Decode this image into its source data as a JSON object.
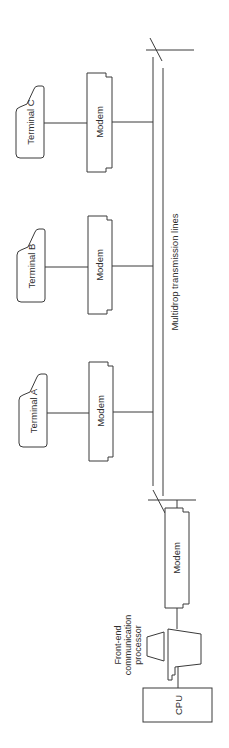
{
  "diagram": {
    "orientation": "rotated-90-ccw",
    "terminals": [
      {
        "id": "C",
        "label": "Terminal C"
      },
      {
        "id": "B",
        "label": "Terminal B"
      },
      {
        "id": "A",
        "label": "Terminal A"
      }
    ],
    "modems": [
      {
        "id": "modem-c",
        "label": "Modem"
      },
      {
        "id": "modem-b",
        "label": "Modem"
      },
      {
        "id": "modem-a",
        "label": "Modem"
      },
      {
        "id": "modem-host",
        "label": "Modem"
      }
    ],
    "bus": {
      "label": "Multidrop transmission lines"
    },
    "processor": {
      "label_lines": [
        "Front-end",
        "communication",
        "processor"
      ]
    },
    "cpu": {
      "label": "CPU"
    },
    "colors": {
      "line": "#3a3a3a",
      "text": "#2e2e2e",
      "background": "#ffffff"
    }
  }
}
